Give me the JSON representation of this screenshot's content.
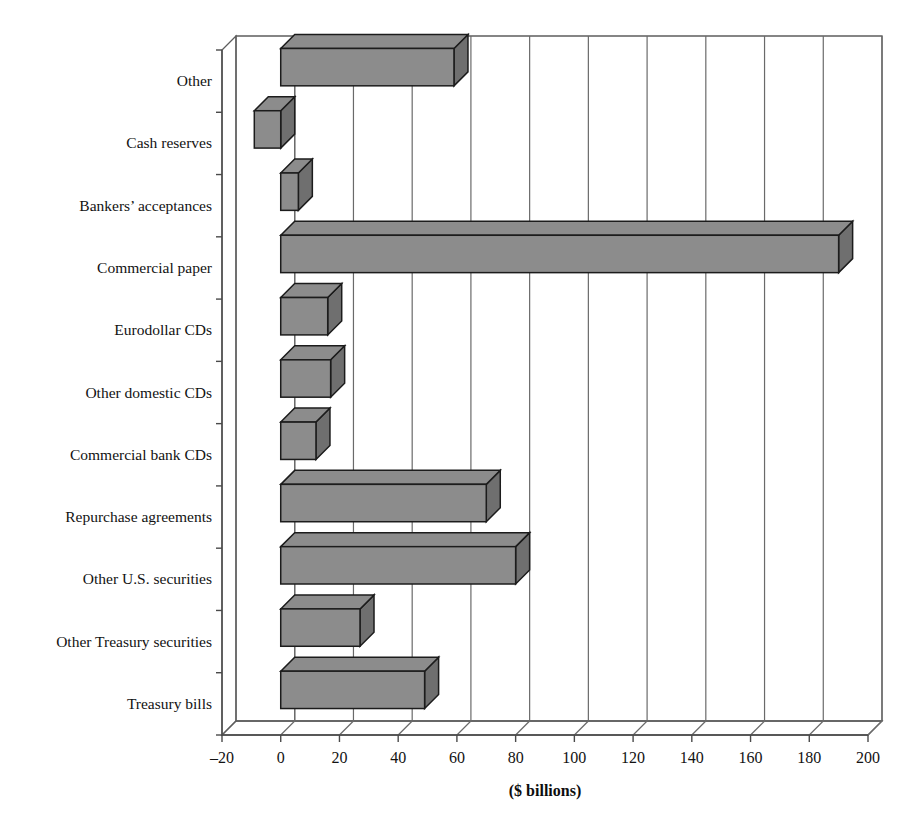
{
  "chart_data": {
    "type": "bar",
    "orientation": "horizontal",
    "style": "3d-isometric",
    "title": "",
    "subtitle": "",
    "xlabel": "($ billions)",
    "ylabel": "",
    "xlim": [
      -20,
      200
    ],
    "xticks": [
      -20,
      0,
      20,
      40,
      60,
      80,
      100,
      120,
      140,
      160,
      180,
      200
    ],
    "xtick_labels": [
      "–20",
      "0",
      "20",
      "40",
      "60",
      "80",
      "100",
      "120",
      "140",
      "160",
      "180",
      "200"
    ],
    "grid": true,
    "grid_axis": "x",
    "legend": null,
    "categories": [
      "Other",
      "Cash reserves",
      "Bankers’ acceptances",
      "Commercial paper",
      "Eurodollar CDs",
      "Other domestic CDs",
      "Commercial bank CDs",
      "Repurchase agreements",
      "Other U.S. securities",
      "Other Treasury securities",
      "Treasury bills"
    ],
    "values": [
      59,
      -9,
      6,
      190,
      16,
      17,
      12,
      70,
      80,
      27,
      49
    ],
    "bar_color": "#8c8c8c",
    "bar_side_color": "#6f6f6f",
    "bar_edge_color": "#1c1c1c"
  },
  "axis": {
    "x_title": "($ billions)"
  }
}
